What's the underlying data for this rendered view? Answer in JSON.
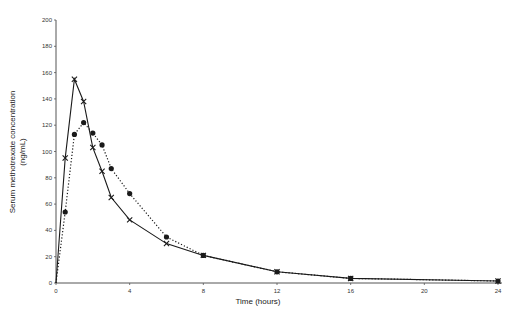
{
  "chart_data": {
    "type": "line",
    "title": "",
    "xlabel": "Time (hours)",
    "ylabel": "Serum methotrexate concentration",
    "ylabel_unit": "(ng/mL)",
    "xlim": [
      0,
      24
    ],
    "ylim": [
      0,
      200
    ],
    "x_ticks": [
      0,
      4,
      8,
      12,
      16,
      20,
      24
    ],
    "y_ticks": [
      0,
      20,
      40,
      60,
      80,
      100,
      120,
      140,
      160,
      180,
      200
    ],
    "grid": false,
    "legend": null,
    "series": [
      {
        "name": "Series A (solid line, x markers)",
        "line_style": "solid",
        "marker": "x",
        "color": "#1a1a1a",
        "x": [
          0,
          0.5,
          1,
          1.5,
          2,
          2.5,
          3,
          4,
          6,
          8,
          12,
          16,
          24
        ],
        "y": [
          0,
          95,
          155,
          138,
          103,
          85,
          65,
          48,
          30,
          21,
          8.5,
          3.5,
          1.5
        ]
      },
      {
        "name": "Series B (dotted line, filled circle markers)",
        "line_style": "dotted",
        "marker": "circle",
        "color": "#1a1a1a",
        "x": [
          0,
          0.5,
          1,
          1.5,
          2,
          2.5,
          3,
          4,
          6,
          8,
          12,
          16,
          24
        ],
        "y": [
          0,
          54,
          113,
          122,
          114,
          105,
          87,
          68,
          35,
          21,
          8.5,
          3.5,
          1.5
        ]
      }
    ]
  }
}
